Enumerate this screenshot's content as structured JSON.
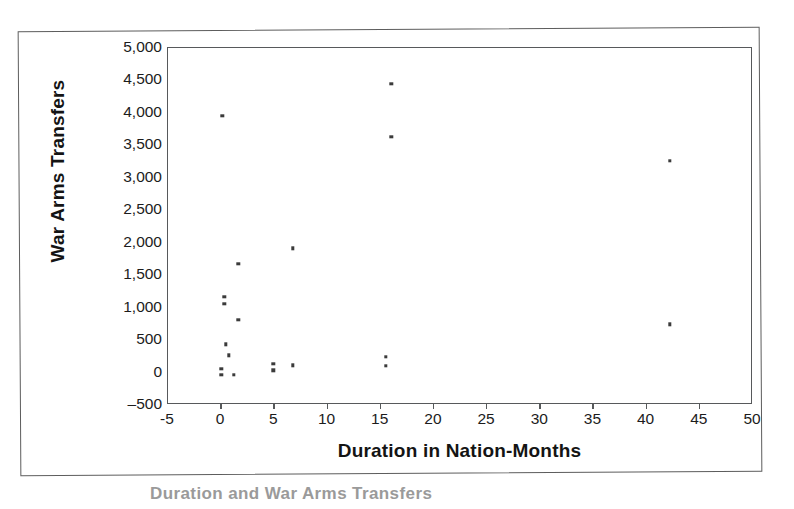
{
  "chart_data": {
    "type": "scatter",
    "title": "",
    "xlabel": "Duration in Nation-Months",
    "ylabel": "War Arms Transfers",
    "xlim": [
      -5,
      50
    ],
    "ylim": [
      -500,
      5000
    ],
    "xticks": [
      "-5",
      "0",
      "5",
      "10",
      "15",
      "20",
      "25",
      "30",
      "35",
      "40",
      "45",
      "50"
    ],
    "xtick_values": [
      -5,
      0,
      5,
      10,
      15,
      20,
      25,
      30,
      35,
      40,
      45,
      50
    ],
    "yticks": [
      "5,000",
      "4,500",
      "4,000",
      "3,500",
      "3,000",
      "2,500",
      "2,000",
      "1,500",
      "1,000",
      "500",
      "0",
      "-500"
    ],
    "ytick_values": [
      5000,
      4500,
      4000,
      3500,
      3000,
      2500,
      2000,
      1500,
      1000,
      500,
      0,
      -500
    ],
    "grid": false,
    "legend": false,
    "marker": "square",
    "marker_color": "#3b3b3b",
    "points": [
      {
        "x": 0.2,
        "y": 3940
      },
      {
        "x": 16.1,
        "y": 4430
      },
      {
        "x": 16.1,
        "y": 3620
      },
      {
        "x": 42.3,
        "y": 3250
      },
      {
        "x": 42.3,
        "y": 730
      },
      {
        "x": 6.8,
        "y": 1900
      },
      {
        "x": 1.7,
        "y": 1660
      },
      {
        "x": 0.4,
        "y": 1150
      },
      {
        "x": 0.4,
        "y": 1040
      },
      {
        "x": 1.7,
        "y": 800
      },
      {
        "x": 0.5,
        "y": 420
      },
      {
        "x": 0.8,
        "y": 250
      },
      {
        "x": 0.1,
        "y": 40
      },
      {
        "x": 0.1,
        "y": -50
      },
      {
        "x": 1.3,
        "y": -50
      },
      {
        "x": 5.0,
        "y": 115
      },
      {
        "x": 5.0,
        "y": 20
      },
      {
        "x": 6.8,
        "y": 95
      },
      {
        "x": 15.6,
        "y": 230
      },
      {
        "x": 15.6,
        "y": 85
      }
    ]
  },
  "caption": {
    "text": "Duration and War Arms Transfers"
  }
}
